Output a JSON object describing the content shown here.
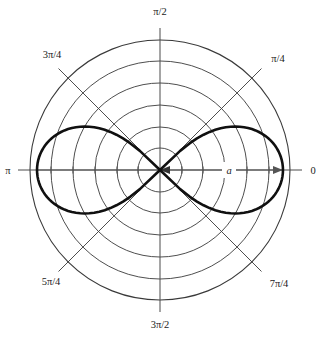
{
  "figure": {
    "name": "polar-plot-lemniscate",
    "background_color": "#ffffff",
    "curve_color": "#101010",
    "grid_color": "#3a3a3a",
    "axis_color": "#4a4a4a",
    "parameter_label": "a",
    "angle_labels": {
      "zero": "0",
      "pi_over_4": "π/4",
      "pi_over_2": "π/2",
      "three_pi_over_4": "3π/4",
      "pi": "π",
      "five_pi_over_4": "5π/4",
      "three_pi_over_2": "3π/2",
      "seven_pi_over_4": "7π/4"
    }
  },
  "chart_data": {
    "type": "line",
    "plot_kind": "polar",
    "title": "",
    "subtitle": "",
    "xlabel": "",
    "ylabel": "",
    "legend": [],
    "grid": true,
    "legend_position": "none",
    "polar": {
      "center_px": [
        160,
        170
      ],
      "outer_radius_px": 130,
      "grid_circle_count": 6,
      "grid_circle_radii_px": [
        22,
        43,
        65,
        87,
        109,
        130
      ],
      "grid_circle_radii_normalized": [
        0.169,
        0.331,
        0.5,
        0.669,
        0.838,
        1.0
      ],
      "angle_tick_degrees": [
        0,
        45,
        90,
        135,
        180,
        225,
        270,
        315
      ],
      "angle_tick_labels": [
        "0",
        "π/4",
        "π/2",
        "3π/4",
        "π",
        "5π/4",
        "3π/2",
        "7π/4"
      ],
      "radial_axis_ticks_px": [
        22,
        43,
        65,
        87,
        109
      ],
      "r_range": [
        0,
        1.0
      ],
      "theta_direction": "counterclockwise",
      "theta_zero_location": "east"
    },
    "curve": {
      "name": "Lemniscate of Bernoulli",
      "equation": "r^2 = a^2 cos(2θ)",
      "parameter": "a",
      "parameter_label": "a",
      "a_value_px": 123,
      "a_value_normalized": 0.946,
      "domain_theta_deg": [
        [
          -45,
          45
        ],
        [
          135,
          225
        ]
      ],
      "annotation": "a",
      "points_theta_deg": [
        -45,
        -40,
        -35,
        -30,
        -25,
        -20,
        -15,
        -10,
        -5,
        0,
        5,
        10,
        15,
        20,
        25,
        30,
        35,
        40,
        45
      ],
      "points_r_normalized": [
        0.0,
        0.414,
        0.561,
        0.669,
        0.752,
        0.818,
        0.871,
        0.912,
        0.942,
        0.946,
        0.942,
        0.912,
        0.871,
        0.818,
        0.752,
        0.669,
        0.561,
        0.414,
        0.0
      ]
    }
  }
}
